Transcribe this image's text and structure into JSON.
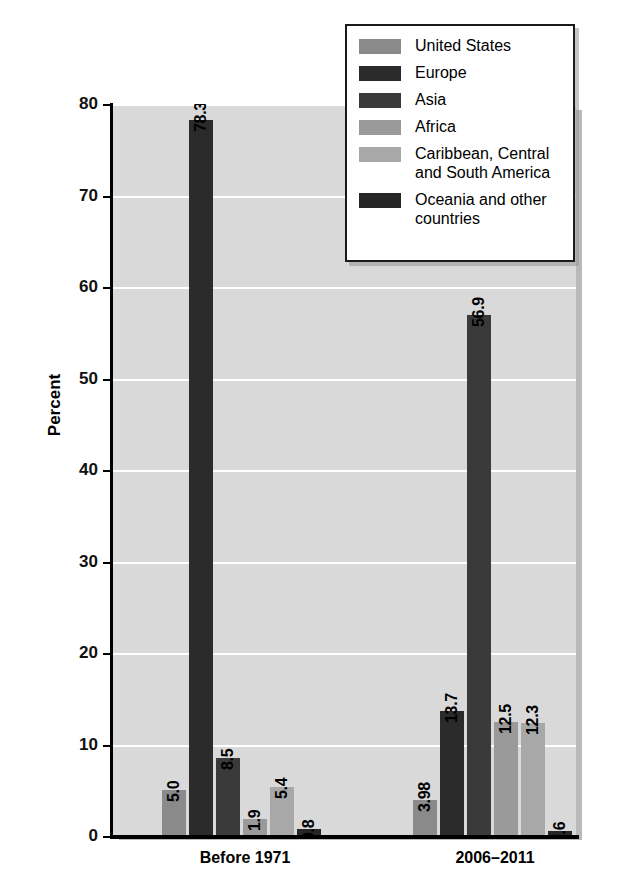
{
  "chart_data": {
    "type": "bar",
    "title": "",
    "subtitle": "",
    "xlabel": "",
    "ylabel": "Percent",
    "ylim": [
      0,
      80
    ],
    "yticks": [
      0,
      10,
      20,
      30,
      40,
      50,
      60,
      70,
      80
    ],
    "ytick_labels": [
      "0",
      "10",
      "20",
      "30",
      "40",
      "50",
      "60",
      "70",
      "80"
    ],
    "grid": true,
    "legend_position": "top-right",
    "categories": [
      "Before 1971",
      "2006–2011"
    ],
    "series": [
      {
        "name": "United States",
        "color": "#8a8a8a",
        "values": [
          5.0,
          3.98
        ],
        "labels": [
          "5.0",
          "3.98"
        ]
      },
      {
        "name": "Europe",
        "color": "#2b2b2b",
        "values": [
          78.3,
          13.7
        ],
        "labels": [
          "78.3",
          "13.7"
        ]
      },
      {
        "name": "Asia",
        "color": "#3a3a3a",
        "values": [
          8.5,
          56.9
        ],
        "labels": [
          "8.5",
          "56.9"
        ]
      },
      {
        "name": "Africa",
        "color": "#9a9a9a",
        "values": [
          1.9,
          12.5
        ],
        "labels": [
          "1.9",
          "12.5"
        ]
      },
      {
        "name": "Caribbean, Central\nand South America",
        "color": "#a8a8a8",
        "values": [
          5.4,
          12.3
        ],
        "labels": [
          "5.4",
          "12.3"
        ]
      },
      {
        "name": "Oceania and other\ncountries",
        "color": "#262626",
        "values": [
          0.8,
          0.6
        ],
        "labels": [
          "0.8",
          "0.6"
        ]
      }
    ]
  },
  "legend": {
    "items": [
      {
        "label": "United States",
        "color": "#8a8a8a"
      },
      {
        "label": "Europe",
        "color": "#2b2b2b"
      },
      {
        "label": "Asia",
        "color": "#3a3a3a"
      },
      {
        "label": "Africa",
        "color": "#9a9a9a"
      },
      {
        "label": "Caribbean, Central\nand South America",
        "color": "#a8a8a8"
      },
      {
        "label": "Oceania and other\ncountries",
        "color": "#262626"
      }
    ]
  },
  "axis": {
    "y_title": "Percent",
    "y_tick_labels": [
      "0",
      "10",
      "20",
      "30",
      "40",
      "50",
      "60",
      "70",
      "80"
    ],
    "x_tick_labels": [
      "Before 1971",
      "2006–2011"
    ]
  },
  "colors": {
    "plot_background": "#d9d9d9",
    "gridline": "#ffffff",
    "axis": "#000000",
    "page_background": "#ffffff"
  }
}
